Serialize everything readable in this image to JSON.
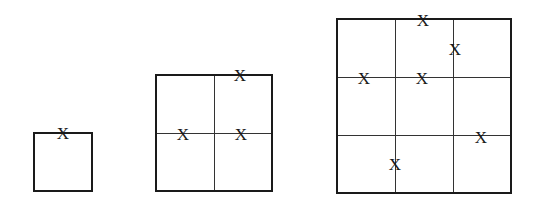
{
  "figure": {
    "grids": [
      {
        "id": "grid-1x1",
        "divisions": 1,
        "box": {
          "left": 33,
          "top": 132,
          "size": 60
        },
        "marks": [
          {
            "label": "X",
            "x": 63,
            "y": 133
          }
        ]
      },
      {
        "id": "grid-2x2",
        "divisions": 2,
        "box": {
          "left": 155,
          "top": 74,
          "size": 118
        },
        "marks": [
          {
            "label": "X",
            "x": 240,
            "y": 75
          },
          {
            "label": "X",
            "x": 183,
            "y": 134
          },
          {
            "label": "X",
            "x": 241,
            "y": 134
          }
        ]
      },
      {
        "id": "grid-3x3",
        "divisions": 3,
        "box": {
          "left": 336,
          "top": 18,
          "size": 176
        },
        "marks": [
          {
            "label": "X",
            "x": 423,
            "y": 20
          },
          {
            "label": "X",
            "x": 455,
            "y": 49
          },
          {
            "label": "X",
            "x": 364,
            "y": 78
          },
          {
            "label": "X",
            "x": 422,
            "y": 78
          },
          {
            "label": "X",
            "x": 481,
            "y": 137
          },
          {
            "label": "X",
            "x": 395,
            "y": 164
          }
        ]
      }
    ]
  }
}
